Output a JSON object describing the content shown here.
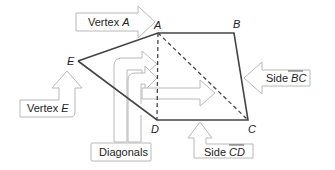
{
  "figure": {
    "vertices": {
      "A": {
        "label": "A",
        "x": 158,
        "y": 33
      },
      "B": {
        "label": "B",
        "x": 234,
        "y": 33
      },
      "C": {
        "label": "C",
        "x": 248,
        "y": 120
      },
      "D": {
        "label": "D",
        "x": 157,
        "y": 120
      },
      "E": {
        "label": "E",
        "x": 78,
        "y": 61
      }
    },
    "edge_color": "#444444",
    "callout_color": "#b8b8b8"
  },
  "callouts": {
    "vertex_a": {
      "prefix": "Vertex ",
      "var": "A"
    },
    "vertex_e": {
      "prefix": "Vertex ",
      "var": "E"
    },
    "side_bc": {
      "prefix": "Side ",
      "var": "BC"
    },
    "side_cd": {
      "prefix": "Side ",
      "var": "CD"
    },
    "diagonals": {
      "text": "Diagonals"
    }
  }
}
